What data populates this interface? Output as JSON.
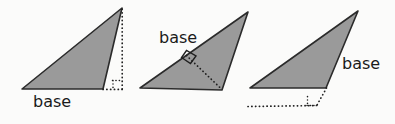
{
  "figure": {
    "background_color": "#fbfbfa",
    "triangle_fill_color": "#9a9a9a",
    "outline_color": "#2b2b2b",
    "label_color": "#1a1a1a"
  },
  "triangles": [
    {
      "id": "triangle-1",
      "label": "base",
      "base_position": "below-bottom-side",
      "altitude_style": "dotted-outside-right",
      "right_angle_marker": true,
      "points": "22,89 122,8 103,89",
      "altitude_path": "M122,8 L122,89",
      "base_extension_path": "M103,89 L122,89",
      "right_angle_path": "M113,80 L113,89 M113,80 L122,80"
    },
    {
      "id": "triangle-2",
      "label": "base",
      "base_position": "above-upper-left-side",
      "altitude_style": "dotted-inside",
      "right_angle_marker": true,
      "points": "140,88 248,12 222,90",
      "altitude_path": "M186,55 L222,90",
      "right_angle_path": "M184,57 L192,64 M192,64 L198,57",
      "right_angle_square": "M183.5,56.5 L191.5,49.5 L198.5,56.5 L191.0,63.5 Z"
    },
    {
      "id": "triangle-3",
      "label": "base",
      "base_position": "right-of-right-side",
      "altitude_style": "dotted-outside-below",
      "right_angle_marker": true,
      "points": "250,88 358,11 326,88",
      "altitude_path": "M326,88 L316,106",
      "base_extension_path": "M250,107 L316,106",
      "right_angle_path": "M307,97 L307,106 M307,106 L316,106"
    }
  ],
  "labels": {
    "label_1": "base",
    "label_2": "base",
    "label_3": "base"
  }
}
